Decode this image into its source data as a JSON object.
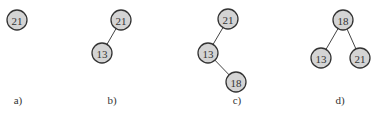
{
  "diagram": {
    "panels": [
      {
        "label": "a)",
        "label_pos": [
          18,
          104
        ],
        "nodes": [
          {
            "value": "21",
            "x": 17,
            "y": 20
          }
        ],
        "edges": []
      },
      {
        "label": "b)",
        "label_pos": [
          112,
          104
        ],
        "nodes": [
          {
            "value": "21",
            "x": 121,
            "y": 20
          },
          {
            "value": "13",
            "x": 102,
            "y": 53
          }
        ],
        "edges": [
          [
            0,
            1
          ]
        ]
      },
      {
        "label": "c)",
        "label_pos": [
          237,
          104
        ],
        "nodes": [
          {
            "value": "21",
            "x": 228,
            "y": 19
          },
          {
            "value": "13",
            "x": 208,
            "y": 53
          },
          {
            "value": "18",
            "x": 236,
            "y": 82
          }
        ],
        "edges": [
          [
            0,
            1
          ],
          [
            1,
            2
          ]
        ]
      },
      {
        "label": "d)",
        "label_pos": [
          340,
          104
        ],
        "nodes": [
          {
            "value": "18",
            "x": 343,
            "y": 20
          },
          {
            "value": "13",
            "x": 321,
            "y": 58
          },
          {
            "value": "21",
            "x": 360,
            "y": 58
          }
        ],
        "edges": [
          [
            0,
            1
          ],
          [
            0,
            2
          ]
        ]
      }
    ],
    "node_radius": 10,
    "colors": {
      "node_fill": "#d4d4d4",
      "node_stroke": "#333333",
      "edge": "#444444",
      "text": "#333333"
    }
  }
}
